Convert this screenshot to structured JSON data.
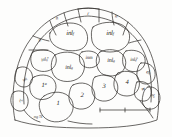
{
  "figure": {
    "ink_color": "#2a2724",
    "background_color": "#fdfdfc"
  },
  "labels": [
    {
      "id": "n-top-left",
      "text": "n",
      "sub": "",
      "sup": "",
      "x": 57,
      "y": 19,
      "size": "sz-s",
      "tilt": "tilt-a"
    },
    {
      "id": "r-top-center",
      "text": "r",
      "sub": "",
      "sup": "",
      "x": 88,
      "y": 14,
      "size": "sz-s",
      "tilt": ""
    },
    {
      "id": "n-top-right",
      "text": "n",
      "sub": "",
      "sup": "",
      "x": 116,
      "y": 17,
      "size": "sz-s",
      "tilt": "tilt-d"
    },
    {
      "id": "n-left-upper",
      "text": "n",
      "sub": "",
      "sup": "",
      "x": 40,
      "y": 41,
      "size": "sz-s",
      "tilt": "tilt-b"
    },
    {
      "id": "inl-f-left",
      "text": "inl",
      "sub": "f",
      "sup": "",
      "x": 70,
      "y": 34,
      "size": "sz-l",
      "tilt": ""
    },
    {
      "id": "inl-f-right",
      "text": "inl",
      "sub": "f",
      "sup": "",
      "x": 110,
      "y": 34,
      "size": "sz-l",
      "tilt": ""
    },
    {
      "id": "inl-g-sup-left",
      "text": "inl",
      "sub": "g",
      "sup": "a",
      "x": 45,
      "y": 60,
      "size": "sz-s",
      "tilt": "tilt-a"
    },
    {
      "id": "inl-g-center",
      "text": "inl",
      "sub": "g",
      "sup": "",
      "x": 69,
      "y": 68,
      "size": "sz-m",
      "tilt": ""
    },
    {
      "id": "inm-center",
      "text": "inm",
      "sub": "",
      "sup": "",
      "x": 89,
      "y": 58,
      "size": "sz-s",
      "tilt": ""
    },
    {
      "id": "inl-g-right",
      "text": "inl",
      "sub": "g",
      "sup": "",
      "x": 111,
      "y": 61,
      "size": "sz-m",
      "tilt": ""
    },
    {
      "id": "inl-g-sup-right",
      "text": "inl",
      "sub": "g",
      "sup": "p",
      "x": 134,
      "y": 60,
      "size": "sz-s",
      "tilt": ""
    },
    {
      "id": "el-f-right",
      "text": "el",
      "sub": "f",
      "sup": "",
      "x": 148,
      "y": 73,
      "size": "sz-s",
      "tilt": "tilt-d"
    },
    {
      "id": "inl-f-far-left",
      "text": "inl",
      "sub": "f",
      "sup": "",
      "x": 25,
      "y": 80,
      "size": "sz-xs",
      "tilt": "tilt-c"
    },
    {
      "id": "rl-g-left",
      "text": "rl",
      "sub": "g",
      "sup": "",
      "x": 21,
      "y": 101,
      "size": "sz-xs",
      "tilt": "tilt-c"
    },
    {
      "id": "el-g-right",
      "text": "el",
      "sub": "g",
      "sup": "",
      "x": 153,
      "y": 96,
      "size": "sz-xs",
      "tilt": "tilt-e"
    },
    {
      "id": "plate-1-prime",
      "text": "1",
      "sub": "",
      "sup": "a",
      "x": 44,
      "y": 86,
      "size": "num",
      "tilt": ""
    },
    {
      "id": "plate-1",
      "text": "1",
      "sub": "",
      "sup": "",
      "x": 58,
      "y": 104,
      "size": "num",
      "tilt": ""
    },
    {
      "id": "plate-2",
      "text": "2",
      "sub": "",
      "sup": "",
      "x": 82,
      "y": 96,
      "size": "num",
      "tilt": ""
    },
    {
      "id": "plate-3",
      "text": "3",
      "sub": "",
      "sup": "",
      "x": 104,
      "y": 87,
      "size": "num",
      "tilt": ""
    },
    {
      "id": "plate-4",
      "text": "4",
      "sub": "",
      "sup": "",
      "x": 127,
      "y": 83,
      "size": "num",
      "tilt": ""
    },
    {
      "id": "plate-4-prime",
      "text": "4",
      "sub": "",
      "sup": "a",
      "x": 143,
      "y": 90,
      "size": "sz-s",
      "tilt": "tilt-e"
    }
  ],
  "caption": {
    "text": "mg 78",
    "x": 38,
    "y": 117
  },
  "scale_bar": {
    "name": "scale-bar",
    "x1": 100,
    "x2": 150,
    "y": 110,
    "tick_x": 125,
    "tick_height": 4
  }
}
